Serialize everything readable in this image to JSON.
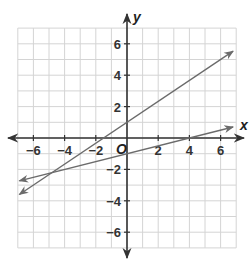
{
  "chart_data": {
    "type": "line",
    "title": "",
    "xlabel": "x",
    "ylabel": "y",
    "origin_label": "O",
    "xlim": [
      -7,
      7
    ],
    "ylim": [
      -7,
      7
    ],
    "grid": true,
    "x_ticks": [
      -6,
      -4,
      -2,
      2,
      4,
      6
    ],
    "y_ticks": [
      6,
      4,
      2,
      -2,
      -4,
      -6
    ],
    "x_tick_labels": [
      "−6",
      "−4",
      "−2",
      "2",
      "4",
      "6"
    ],
    "y_tick_labels": [
      "6",
      "4",
      "2",
      "−2",
      "−4",
      "−6"
    ],
    "series": [
      {
        "name": "line-1",
        "equation": "y = (2/3)x + 1",
        "slope": 0.6667,
        "intercept": 1,
        "x": [
          -6.9,
          6.8
        ],
        "y": [
          -3.6,
          5.53
        ],
        "color": "#6b6b6b"
      },
      {
        "name": "line-2",
        "equation": "y = (1/4)x - 1",
        "slope": 0.25,
        "intercept": -1,
        "x": [
          -6.9,
          6.8
        ],
        "y": [
          -2.73,
          0.7
        ],
        "color": "#6b6b6b"
      }
    ],
    "intersection": {
      "x": -4.8,
      "y": -2.2
    }
  },
  "colors": {
    "grid": "#d4d4d4",
    "axis": "#333333",
    "line": "#6b6b6b",
    "background": "#ffffff"
  }
}
